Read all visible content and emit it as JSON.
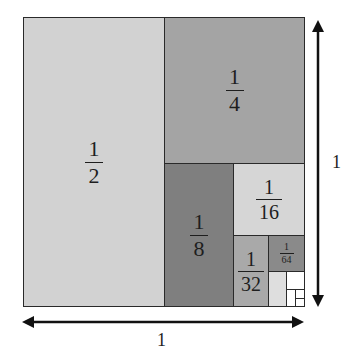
{
  "diagram": {
    "colors": {
      "half": "#d2d2d2",
      "quarter": "#a4a4a4",
      "eighth": "#7f7f7f",
      "sixteenth": "#d6d6d6",
      "thirtysecond": "#a9a9a9",
      "sixtyfourth": "#8a8a8a",
      "onetwentyeighth": "#dedede",
      "rest": "#ffffff",
      "border": "#2a2a2a"
    },
    "regions": [
      {
        "id": "half",
        "numerator": "1",
        "denominator": "2"
      },
      {
        "id": "quarter",
        "numerator": "1",
        "denominator": "4"
      },
      {
        "id": "eighth",
        "numerator": "1",
        "denominator": "8"
      },
      {
        "id": "sixteenth",
        "numerator": "1",
        "denominator": "16"
      },
      {
        "id": "thirtysecond",
        "numerator": "1",
        "denominator": "32"
      },
      {
        "id": "sixtyfourth",
        "numerator": "1",
        "denominator": "64"
      }
    ],
    "width_label": "1",
    "height_label": "1"
  }
}
